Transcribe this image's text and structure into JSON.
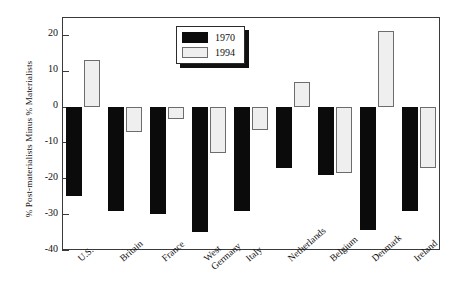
{
  "chart_data": {
    "type": "bar",
    "title": "",
    "subtitle": "",
    "xlabel": "",
    "ylabel": "% Post-materialists Minus % Materialists",
    "ylim": [
      -40,
      25
    ],
    "yticks": [
      20,
      10,
      0,
      -10,
      -20,
      -30,
      -40
    ],
    "ytick_labels": [
      "20",
      "10",
      "0",
      "-10",
      "-20",
      "-30",
      "-40"
    ],
    "grid": false,
    "legend_position": "top-center",
    "categories": [
      "U.S.",
      "Britain",
      "France",
      "West Germany",
      "Italy",
      "Netherlands",
      "Belgium",
      "Denmark",
      "Ireland"
    ],
    "category_lines": [
      [
        "U.S."
      ],
      [
        "Britain"
      ],
      [
        "France"
      ],
      [
        "West",
        "Germany"
      ],
      [
        "Italy"
      ],
      [
        "Netherlands"
      ],
      [
        "Belgium"
      ],
      [
        "Denmark"
      ],
      [
        "Ireland"
      ]
    ],
    "series": [
      {
        "name": "1970",
        "color": "#0b0b0b",
        "values": [
          -25,
          -29,
          -30,
          -35,
          -29,
          -17,
          -19,
          -34.5,
          -29
        ]
      },
      {
        "name": "1994",
        "color": "#efefef",
        "values": [
          13,
          -7,
          -3.5,
          -13,
          -6.5,
          7,
          -18.5,
          21,
          -17
        ]
      }
    ]
  },
  "legend": {
    "items": [
      {
        "label": "1970",
        "swatch": "black-swatch"
      },
      {
        "label": "1994",
        "swatch": "light-swatch"
      }
    ]
  }
}
